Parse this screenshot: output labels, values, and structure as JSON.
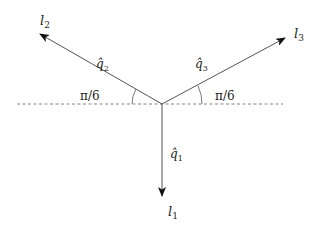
{
  "diagram": {
    "type": "vector-diagram",
    "origin": {
      "x": 162,
      "y": 104
    },
    "reference_line": {
      "style": "dashed",
      "x1": 17,
      "x2": 283,
      "y": 104
    },
    "vectors": [
      {
        "id": "l1",
        "label": "l",
        "label_sub": "1",
        "unit": "q̂",
        "unit_sub": "1",
        "tip": {
          "x": 162,
          "y": 198
        }
      },
      {
        "id": "l2",
        "label": "l",
        "label_sub": "2",
        "unit": "q̂",
        "unit_sub": "2",
        "tip": {
          "x": 38,
          "y": 33
        }
      },
      {
        "id": "l3",
        "label": "l",
        "label_sub": "3",
        "unit": "q̂",
        "unit_sub": "3",
        "tip": {
          "x": 287,
          "y": 38
        }
      }
    ],
    "angles": [
      {
        "label": "π/6",
        "side": "left"
      },
      {
        "label": "π/6",
        "side": "right"
      }
    ],
    "colors": {
      "line": "#555555",
      "text": "#222222"
    }
  }
}
